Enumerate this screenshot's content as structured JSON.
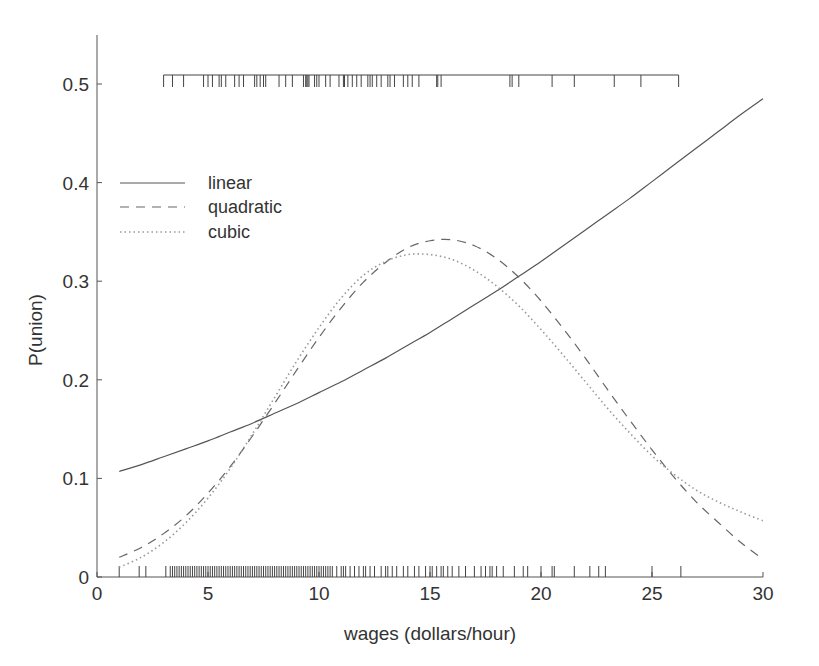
{
  "chart_data": {
    "type": "line",
    "title": "",
    "xlabel": "wages (dollars/hour)",
    "ylabel": "P(union)",
    "xlim": [
      0,
      30
    ],
    "ylim": [
      0,
      0.55
    ],
    "xticks": [
      0,
      5,
      10,
      15,
      20,
      25,
      30
    ],
    "xtick_labels": [
      "0",
      "5",
      "10",
      "15",
      "20",
      "25",
      "30"
    ],
    "yticks": [
      0,
      0.1,
      0.2,
      0.3,
      0.4,
      0.5
    ],
    "ytick_labels": [
      "0",
      "0.1",
      "0.2",
      "0.3",
      "0.4",
      "0.5"
    ],
    "grid": false,
    "legend_position": "upper left",
    "x": [
      1,
      2,
      3,
      4,
      5,
      6,
      7,
      8,
      9,
      10,
      11,
      12,
      13,
      14,
      15,
      16,
      17,
      18,
      19,
      20,
      21,
      22,
      23,
      24,
      25,
      26,
      27,
      28,
      29,
      30
    ],
    "series": [
      {
        "name": "linear",
        "style": "solid",
        "values": [
          0.107,
          0.114,
          0.122,
          0.13,
          0.138,
          0.147,
          0.156,
          0.166,
          0.176,
          0.187,
          0.198,
          0.21,
          0.222,
          0.235,
          0.248,
          0.262,
          0.276,
          0.29,
          0.305,
          0.32,
          0.336,
          0.352,
          0.368,
          0.384,
          0.401,
          0.418,
          0.435,
          0.452,
          0.469,
          0.485
        ]
      },
      {
        "name": "quadratic",
        "style": "dashed",
        "values": [
          0.02,
          0.03,
          0.044,
          0.062,
          0.085,
          0.112,
          0.143,
          0.176,
          0.21,
          0.243,
          0.273,
          0.299,
          0.319,
          0.334,
          0.341,
          0.342,
          0.336,
          0.323,
          0.304,
          0.28,
          0.252,
          0.222,
          0.19,
          0.159,
          0.129,
          0.101,
          0.076,
          0.055,
          0.035,
          0.018
        ]
      },
      {
        "name": "cubic",
        "style": "dotted",
        "values": [
          0.01,
          0.02,
          0.035,
          0.055,
          0.08,
          0.11,
          0.145,
          0.182,
          0.219,
          0.253,
          0.283,
          0.306,
          0.32,
          0.327,
          0.327,
          0.322,
          0.311,
          0.295,
          0.275,
          0.251,
          0.225,
          0.198,
          0.171,
          0.146,
          0.123,
          0.104,
          0.088,
          0.076,
          0.066,
          0.057
        ]
      }
    ],
    "rug_top": {
      "label": "union members",
      "y_level": 0.5,
      "x": [
        3.0,
        3.4,
        3.9,
        4.8,
        5.0,
        5.2,
        5.5,
        5.6,
        5.8,
        6.2,
        6.4,
        6.6,
        7.1,
        7.2,
        7.35,
        7.5,
        7.6,
        8.2,
        8.5,
        8.8,
        9.3,
        9.4,
        9.45,
        9.5,
        9.55,
        9.8,
        9.9,
        10.0,
        10.3,
        10.5,
        10.9,
        11.1,
        11.15,
        11.3,
        11.5,
        11.7,
        11.9,
        12.2,
        12.3,
        12.4,
        12.6,
        12.8,
        13.1,
        13.2,
        13.4,
        13.8,
        14.0,
        14.2,
        14.5,
        15.3,
        15.35,
        15.5,
        18.6,
        18.7,
        19.0,
        20.5,
        21.5,
        23.3,
        24.5,
        26.2
      ]
    },
    "rug_bottom": {
      "label": "non-union",
      "y_level": 0,
      "x": [
        1.0,
        1.9,
        2.2,
        3.1,
        3.3,
        3.4,
        3.5,
        3.6,
        3.7,
        3.8,
        3.9,
        4.0,
        4.1,
        4.2,
        4.3,
        4.4,
        4.5,
        4.6,
        4.7,
        4.8,
        4.9,
        5.0,
        5.1,
        5.2,
        5.3,
        5.4,
        5.5,
        5.6,
        5.7,
        5.8,
        5.9,
        6.0,
        6.1,
        6.2,
        6.3,
        6.4,
        6.5,
        6.6,
        6.7,
        6.8,
        6.9,
        7.0,
        7.1,
        7.2,
        7.3,
        7.4,
        7.5,
        7.6,
        7.7,
        7.8,
        7.9,
        8.0,
        8.1,
        8.2,
        8.3,
        8.4,
        8.5,
        8.6,
        8.7,
        8.8,
        8.9,
        9.0,
        9.1,
        9.2,
        9.3,
        9.4,
        9.5,
        9.6,
        9.7,
        9.8,
        9.9,
        10.0,
        10.1,
        10.2,
        10.3,
        10.4,
        10.5,
        10.6,
        10.8,
        11.0,
        11.1,
        11.2,
        11.4,
        11.6,
        11.8,
        12.0,
        12.1,
        12.3,
        12.5,
        12.8,
        13.0,
        13.1,
        13.3,
        13.5,
        13.8,
        14.0,
        14.3,
        14.5,
        14.8,
        15.0,
        15.1,
        15.3,
        15.5,
        15.6,
        15.8,
        16.0,
        16.3,
        16.6,
        17.0,
        17.3,
        17.5,
        17.7,
        17.8,
        18.0,
        18.3,
        18.8,
        19.2,
        19.4,
        20.0,
        20.5,
        20.6,
        21.5,
        22.2,
        22.6,
        22.9,
        25.0,
        26.3
      ]
    }
  },
  "axes": {
    "x_title": "wages (dollars/hour)",
    "y_title": "P(union)"
  },
  "legend": {
    "items": [
      {
        "label": "linear",
        "style": "solid"
      },
      {
        "label": "quadratic",
        "style": "dashed"
      },
      {
        "label": "cubic",
        "style": "dotted"
      }
    ]
  },
  "colors": {
    "axis": "#555555",
    "linear": "#555555",
    "quadratic": "#666666",
    "cubic": "#999999",
    "rug": "#444444",
    "text": "#333333"
  }
}
